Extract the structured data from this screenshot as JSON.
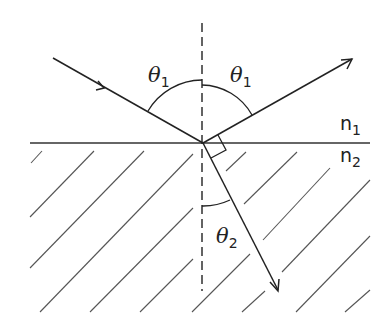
{
  "diagram": {
    "labels": {
      "incident_angle": {
        "symbol": "θ",
        "subscript": "1"
      },
      "reflected_angle": {
        "symbol": "θ",
        "subscript": "1"
      },
      "refracted_angle": {
        "symbol": "θ",
        "subscript": "2"
      },
      "medium_top": {
        "symbol": "n",
        "subscript": "1"
      },
      "medium_bottom": {
        "symbol": "n",
        "subscript": "2"
      }
    },
    "elements": [
      "interface-line",
      "normal-line (dashed)",
      "incident-ray (arrow mid-ray)",
      "reflected-ray (arrowhead at end)",
      "refracted-ray (arrowhead at end)",
      "right-angle-marker between reflected and refracted rays",
      "hatched lower medium"
    ],
    "colors": {
      "stroke": "#222222",
      "hatch": "#555555",
      "background": "#ffffff"
    }
  }
}
